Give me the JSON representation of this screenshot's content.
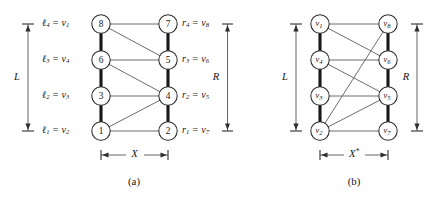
{
  "figure": {
    "caption_a": "(a)",
    "caption_b": "(b)",
    "bracket_L": "L",
    "bracket_R": "R",
    "width_a": "X",
    "width_b": "X*",
    "width_b_base": "X",
    "width_b_star": "*"
  },
  "panel_a": {
    "left_nodes": [
      {
        "id": "n8",
        "label": "8",
        "x": 101,
        "y": 24
      },
      {
        "id": "n6",
        "label": "6",
        "x": 101,
        "y": 60
      },
      {
        "id": "n3",
        "label": "3",
        "x": 101,
        "y": 96
      },
      {
        "id": "n1",
        "label": "1",
        "x": 101,
        "y": 131
      }
    ],
    "right_nodes": [
      {
        "id": "n7",
        "label": "7",
        "x": 168,
        "y": 24
      },
      {
        "id": "n5",
        "label": "5",
        "x": 168,
        "y": 60
      },
      {
        "id": "n4",
        "label": "4",
        "x": 168,
        "y": 96
      },
      {
        "id": "n2",
        "label": "2",
        "x": 168,
        "y": 131
      }
    ],
    "left_labels": [
      {
        "lhs": "l",
        "lhs_sub": "4",
        "rhs": "v",
        "rhs_sub": "1",
        "text": "ℓ₄ = v₁"
      },
      {
        "lhs": "l",
        "lhs_sub": "3",
        "rhs": "v",
        "rhs_sub": "4",
        "text": "ℓ₃ = v₄"
      },
      {
        "lhs": "l",
        "lhs_sub": "2",
        "rhs": "v",
        "rhs_sub": "3",
        "text": "ℓ₂ = v₃"
      },
      {
        "lhs": "l",
        "lhs_sub": "1",
        "rhs": "v",
        "rhs_sub": "2",
        "text": "ℓ₁ = v₂"
      }
    ],
    "right_labels": [
      {
        "lhs": "r",
        "lhs_sub": "4",
        "rhs": "v",
        "rhs_sub": "8",
        "text": "r₄ = v₈"
      },
      {
        "lhs": "r",
        "lhs_sub": "3",
        "rhs": "v",
        "rhs_sub": "6",
        "text": "r₃ = v₆"
      },
      {
        "lhs": "r",
        "lhs_sub": "2",
        "rhs": "v",
        "rhs_sub": "5",
        "text": "r₂ = v₅"
      },
      {
        "lhs": "r",
        "lhs_sub": "1",
        "rhs": "v",
        "rhs_sub": "7",
        "text": "r₁ = v₇"
      }
    ],
    "spine_edges": [
      [
        "n8",
        "n6"
      ],
      [
        "n6",
        "n3"
      ],
      [
        "n3",
        "n1"
      ],
      [
        "n7",
        "n5"
      ],
      [
        "n5",
        "n4"
      ],
      [
        "n4",
        "n2"
      ]
    ],
    "cross_edges": [
      [
        "n8",
        "n7"
      ],
      [
        "n8",
        "n5"
      ],
      [
        "n6",
        "n5"
      ],
      [
        "n6",
        "n4"
      ],
      [
        "n3",
        "n4"
      ],
      [
        "n1",
        "n4"
      ],
      [
        "n1",
        "n2"
      ]
    ]
  },
  "panel_b": {
    "left_nodes": [
      {
        "id": "v1",
        "label": "v",
        "sub": "1",
        "x": 320,
        "y": 24
      },
      {
        "id": "v4",
        "label": "v",
        "sub": "4",
        "x": 320,
        "y": 60
      },
      {
        "id": "v3",
        "label": "v",
        "sub": "3",
        "x": 320,
        "y": 96
      },
      {
        "id": "v2",
        "label": "v",
        "sub": "2",
        "x": 320,
        "y": 131
      }
    ],
    "right_nodes": [
      {
        "id": "v8",
        "label": "v",
        "sub": "8",
        "x": 388,
        "y": 24
      },
      {
        "id": "v6",
        "label": "v",
        "sub": "6",
        "x": 388,
        "y": 60
      },
      {
        "id": "v5",
        "label": "v",
        "sub": "5",
        "x": 388,
        "y": 96
      },
      {
        "id": "v7",
        "label": "v",
        "sub": "7",
        "x": 388,
        "y": 131
      }
    ],
    "spine_edges": [
      [
        "v1",
        "v4"
      ],
      [
        "v4",
        "v3"
      ],
      [
        "v3",
        "v2"
      ],
      [
        "v8",
        "v6"
      ],
      [
        "v6",
        "v5"
      ],
      [
        "v5",
        "v7"
      ]
    ],
    "cross_edges": [
      [
        "v1",
        "v8"
      ],
      [
        "v1",
        "v6"
      ],
      [
        "v4",
        "v6"
      ],
      [
        "v4",
        "v5"
      ],
      [
        "v3",
        "v5"
      ],
      [
        "v2",
        "v5"
      ],
      [
        "v2",
        "v7"
      ],
      [
        "v2",
        "v8"
      ]
    ]
  },
  "colors": {
    "node_stroke": "#2b2b2b",
    "node_fill": "#ffffff",
    "edge_thin": "#6d6d6d",
    "spine_thick": "#171717",
    "dim": "#4a4a4a",
    "text": "#171717",
    "background": "#ffffff"
  }
}
